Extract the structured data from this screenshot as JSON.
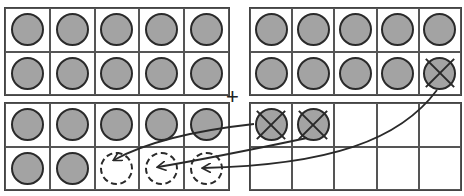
{
  "diagram": {
    "operator": "+",
    "frames": [
      {
        "id": "left-top",
        "cells": [
          "filled",
          "filled",
          "filled",
          "filled",
          "filled",
          "filled",
          "filled",
          "filled",
          "filled",
          "filled"
        ]
      },
      {
        "id": "left-bottom",
        "cells": [
          "filled",
          "filled",
          "filled",
          "filled",
          "filled",
          "filled",
          "filled",
          "ghost",
          "ghost",
          "ghost"
        ]
      },
      {
        "id": "right-top",
        "cells": [
          "filled",
          "filled",
          "filled",
          "filled",
          "filled",
          "filled",
          "filled",
          "filled",
          "filled",
          "crossed"
        ]
      },
      {
        "id": "right-bottom",
        "cells": [
          "crossed",
          "crossed",
          "empty",
          "empty",
          "empty",
          "empty",
          "empty",
          "empty",
          "empty",
          "empty"
        ]
      }
    ],
    "arrows": [
      {
        "from": "right-bottom cell 1",
        "to": "left-bottom cell 8"
      },
      {
        "from": "right-bottom cell 2",
        "to": "left-bottom cell 9"
      },
      {
        "from": "right-top cell 10",
        "to": "left-bottom cell 10"
      }
    ],
    "colors": {
      "counter_fill": "#a3a3a3",
      "stroke": "#2a2a2a"
    }
  }
}
